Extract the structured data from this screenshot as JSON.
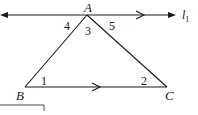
{
  "diagram": {
    "type": "geometry-triangle-parallel-lines",
    "line_label": "l",
    "line_subscript": "1",
    "vertices": {
      "A": {
        "label": "A",
        "x": 87,
        "y": 15
      },
      "B": {
        "label": "B",
        "x": 25,
        "y": 87
      },
      "C": {
        "label": "C",
        "x": 167,
        "y": 87
      }
    },
    "angles": [
      {
        "label": "1",
        "x": 44,
        "y": 83
      },
      {
        "label": "2",
        "x": 143,
        "y": 83
      },
      {
        "label": "3",
        "x": 89,
        "y": 35
      },
      {
        "label": "4",
        "x": 67,
        "y": 28
      },
      {
        "label": "5",
        "x": 112,
        "y": 28
      }
    ],
    "colors": {
      "stroke": "#1a1a1a",
      "background": "#ffffff"
    }
  }
}
